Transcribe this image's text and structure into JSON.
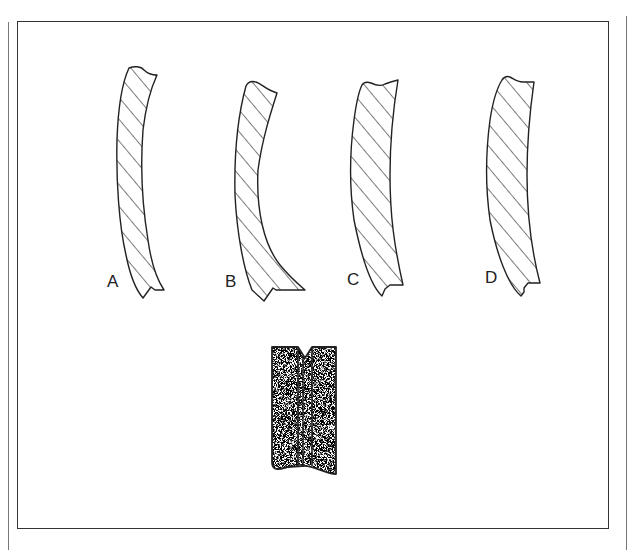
{
  "figure": {
    "profiles": [
      {
        "id": "A",
        "label": "A"
      },
      {
        "id": "B",
        "label": "B"
      },
      {
        "id": "C",
        "label": "C"
      },
      {
        "id": "D",
        "label": "D"
      }
    ],
    "lower_block": {
      "description": "stippled block with V-groove and two vertical lines"
    },
    "colors": {
      "line": "#222222",
      "frame": "#333333",
      "background": "#ffffff"
    }
  }
}
